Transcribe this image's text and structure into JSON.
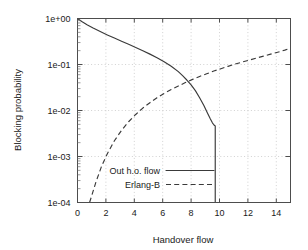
{
  "chart_data": {
    "type": "line",
    "title": "",
    "xlabel": "Handover flow",
    "ylabel": "Blocking probability",
    "xlim": [
      0,
      15
    ],
    "ylim": [
      0.0001,
      1
    ],
    "yscale": "log",
    "xscale": "linear",
    "grid": true,
    "legend_position": "inside-bottom-left",
    "xticks": [
      0,
      2,
      4,
      6,
      8,
      10,
      12,
      14
    ],
    "xticklabels": [
      "0",
      "2",
      "4",
      "6",
      "8",
      "10",
      "12",
      "14"
    ],
    "yticks": [
      1,
      0.1,
      0.01,
      0.001,
      0.0001
    ],
    "yticklabels": [
      "1e+00",
      "1e-01",
      "1e-02",
      "1e-03",
      "1e-04"
    ],
    "series": [
      {
        "name": "Out h.o. flow",
        "style": "solid",
        "color": "#3a3a3a",
        "x": [
          0.0,
          0.3,
          0.7,
          1.1,
          1.6,
          2.1,
          2.6,
          3.1,
          3.6,
          4.1,
          4.6,
          5.1,
          5.6,
          6.1,
          6.6,
          7.1,
          7.4,
          7.7,
          8.0,
          8.3,
          8.6,
          8.9,
          9.15,
          9.35,
          9.5,
          9.6,
          9.66,
          9.7,
          9.7,
          9.7
        ],
        "y": [
          1.0,
          0.86,
          0.72,
          0.62,
          0.52,
          0.44,
          0.375,
          0.32,
          0.275,
          0.235,
          0.2,
          0.168,
          0.14,
          0.115,
          0.092,
          0.07,
          0.0575,
          0.046,
          0.036,
          0.027,
          0.019,
          0.0128,
          0.0088,
          0.0066,
          0.0054,
          0.0049,
          0.0047,
          0.0046,
          0.0012,
          0.0001
        ]
      },
      {
        "name": "Erlang-B",
        "style": "dashed",
        "color": "#3a3a3a",
        "x": [
          0.85,
          1.0,
          1.3,
          1.7,
          2.1,
          2.6,
          3.1,
          3.6,
          4.1,
          4.6,
          5.1,
          5.6,
          6.1,
          6.6,
          7.1,
          7.6,
          8.1,
          8.6,
          9.1,
          9.6,
          10.1,
          10.6,
          11.1,
          11.6,
          12.1,
          12.6,
          13.1,
          13.6,
          14.1,
          14.6,
          15.0
        ],
        "y": [
          0.0001,
          0.00014,
          0.00028,
          0.00062,
          0.00115,
          0.0022,
          0.0037,
          0.0057,
          0.0082,
          0.0113,
          0.0148,
          0.019,
          0.0235,
          0.0285,
          0.034,
          0.0405,
          0.0475,
          0.055,
          0.063,
          0.072,
          0.081,
          0.091,
          0.102,
          0.113,
          0.125,
          0.138,
          0.152,
          0.168,
          0.185,
          0.205,
          0.225
        ]
      }
    ],
    "legend_entries": [
      {
        "label": "Out h.o. flow",
        "style": "solid"
      },
      {
        "label": "Erlang-B",
        "style": "dashed"
      }
    ],
    "colors": {
      "background": "#ffffff",
      "frame": "#4d4d4d",
      "grid": "#bdbdbd",
      "curve": "#3a3a3a",
      "text": "#1a1a1a"
    }
  }
}
